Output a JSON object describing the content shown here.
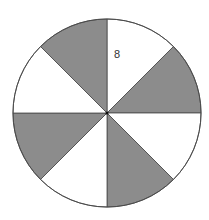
{
  "diagram": {
    "type": "fraction-circle",
    "center": {
      "x": 107,
      "y": 113
    },
    "radius": 94,
    "sector_count": 8,
    "colors": {
      "shaded": "#8c8c8c",
      "unshaded": "#ffffff",
      "stroke": "#4a4a4a",
      "label": "#333333"
    },
    "sectors": [
      {
        "index": 0,
        "start_deg": 0,
        "end_deg": 45,
        "shaded": false
      },
      {
        "index": 1,
        "start_deg": 45,
        "end_deg": 90,
        "shaded": true
      },
      {
        "index": 2,
        "start_deg": 90,
        "end_deg": 135,
        "shaded": false
      },
      {
        "index": 3,
        "start_deg": 135,
        "end_deg": 180,
        "shaded": true
      },
      {
        "index": 4,
        "start_deg": 180,
        "end_deg": 225,
        "shaded": false
      },
      {
        "index": 5,
        "start_deg": 225,
        "end_deg": 270,
        "shaded": true
      },
      {
        "index": 6,
        "start_deg": 270,
        "end_deg": 315,
        "shaded": false
      },
      {
        "index": 7,
        "start_deg": 315,
        "end_deg": 360,
        "shaded": true
      }
    ],
    "shaded_count": 4,
    "label": {
      "text": "8",
      "x": 114,
      "y": 58
    }
  }
}
